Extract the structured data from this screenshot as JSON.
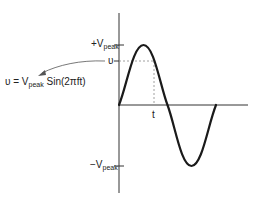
{
  "diagram": {
    "labels": {
      "pos_peak_prefix": "+V",
      "pos_peak_sub": "peak",
      "neg_peak_prefix": "−V",
      "neg_peak_sub": "peak",
      "instant_value": "υ",
      "time": "t",
      "equation_lhs": "υ = V",
      "equation_sub": "peak",
      "equation_rhs": " Sin(2πft)"
    },
    "colors": {
      "wave": "#1a1a1a",
      "axis": "#333333",
      "dashed": "#888888",
      "arrow": "#555555"
    }
  }
}
